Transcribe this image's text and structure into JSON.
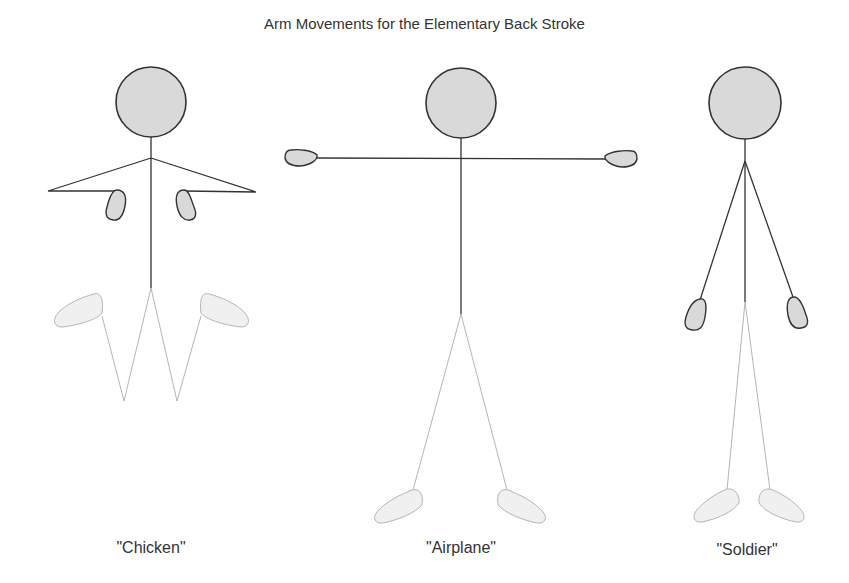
{
  "title": "Arm Movements for the Elementary Back Stroke",
  "figures": [
    {
      "label": "\"Chicken\"",
      "pose": "chicken"
    },
    {
      "label": "\"Airplane\"",
      "pose": "airplane"
    },
    {
      "label": "\"Soldier\"",
      "pose": "soldier"
    }
  ],
  "colors": {
    "outline": "#333333",
    "fill": "#d9d9d9",
    "legs": "#b5b5b5",
    "feet_fill": "#f0f0f0",
    "text": "#333333"
  }
}
